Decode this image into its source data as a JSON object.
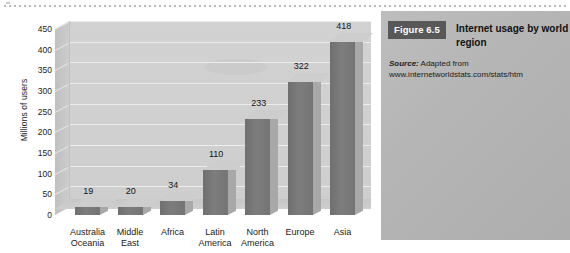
{
  "chart_data": {
    "type": "bar",
    "title": "",
    "xlabel": "",
    "ylabel": "Millions of users",
    "categories": [
      "Australia\nOceania",
      "Middle\nEast",
      "Africa",
      "Latin\nAmerica",
      "North\nAmerica",
      "Europe",
      "Asia"
    ],
    "category_lines": [
      [
        "Australia",
        "Oceania"
      ],
      [
        "Middle",
        "East"
      ],
      [
        "Africa",
        ""
      ],
      [
        "Latin",
        "America"
      ],
      [
        "North",
        "America"
      ],
      [
        "Europe",
        ""
      ],
      [
        "Asia",
        ""
      ]
    ],
    "values": [
      19,
      20,
      34,
      110,
      233,
      322,
      418
    ],
    "data_labels": [
      "19",
      "20",
      "34",
      "110",
      "233",
      "322",
      "418"
    ],
    "ylim": [
      0,
      450
    ],
    "ytick_labels": [
      "0",
      "50",
      "100",
      "150",
      "200",
      "250",
      "300",
      "350",
      "400",
      "450"
    ],
    "ytick_values": [
      0,
      50,
      100,
      150,
      200,
      250,
      300,
      350,
      400,
      450
    ],
    "grid": true,
    "legend": "none",
    "style": "3d-column",
    "colors": {
      "bar_front": "#757575",
      "bar_top": "#cdcdcd",
      "bar_side": "#a8a8a8",
      "plot_background": "#d0d0d0",
      "gridline": "#ececec",
      "caption_panel": "#b6b6b6",
      "badge": "#585858"
    }
  },
  "caption": {
    "badge": "Figure 6.5",
    "title": "Internet usage by world region",
    "source_label": "Source:",
    "source_text": "Adapted from",
    "source_url": "www.internetworldstats.com/stats/htm"
  }
}
